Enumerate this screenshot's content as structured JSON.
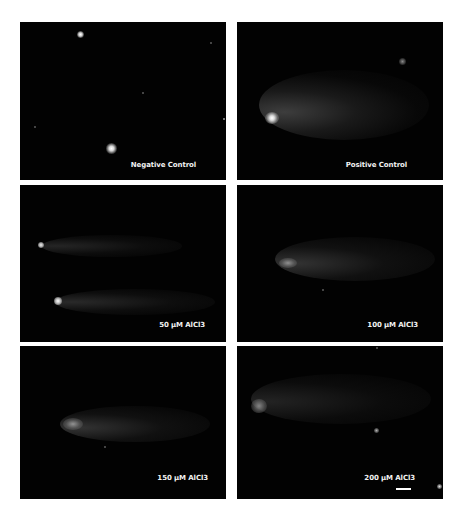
{
  "figure": {
    "layout": "3x2 grid of fluorescence microscopy panels (comet assay)",
    "background": "#ffffff",
    "panels": [
      {
        "id": "negative-control",
        "label": "Negative Control",
        "row": 1,
        "col": 1
      },
      {
        "id": "positive-control",
        "label": "Positive Control",
        "row": 1,
        "col": 2
      },
      {
        "id": "50uM",
        "label": "50 µM AlCl3",
        "row": 2,
        "col": 1
      },
      {
        "id": "100uM",
        "label": "100 µM AlCl3",
        "row": 2,
        "col": 2
      },
      {
        "id": "150uM",
        "label": "150 µM AlCl3",
        "row": 3,
        "col": 1
      },
      {
        "id": "200uM",
        "label": "200 µM AlCl3",
        "row": 3,
        "col": 2
      }
    ],
    "scale_bar": {
      "panel": "200uM",
      "color": "#ffffff"
    },
    "colors": {
      "panel_bg": "#020202",
      "label_text": "#f2f2f2",
      "nucleus_bright": "#ffffff",
      "comet_tail": "#5a5a5a"
    }
  }
}
